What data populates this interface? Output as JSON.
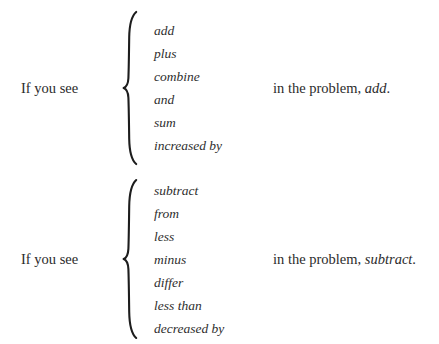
{
  "document": {
    "background_color": "#ffffff",
    "text_color": "#2b2b2b"
  },
  "blocks": [
    {
      "id": "addition-rule",
      "lead_label": "If you see",
      "brace": "left-curly-brace",
      "words": [
        "add",
        "plus",
        "combine",
        "and",
        "sum",
        "increased by"
      ],
      "tail_prefix": "in the problem,",
      "tail_operation": "add",
      "tail_period": "."
    },
    {
      "id": "subtraction-rule",
      "lead_label": "If you see",
      "brace": "left-curly-brace",
      "words": [
        "subtract",
        "from",
        "less",
        "minus",
        "differ",
        "less than",
        "decreased by"
      ],
      "tail_prefix": "in the problem,",
      "tail_operation": "subtract",
      "tail_period": "."
    }
  ]
}
